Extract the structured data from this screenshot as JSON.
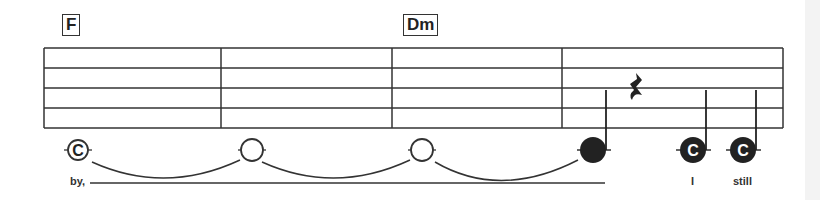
{
  "sheet": {
    "chords": [
      {
        "label": "F",
        "x": 68,
        "y": 17
      },
      {
        "label": "Dm",
        "x": 405,
        "y": 17
      }
    ],
    "staff": {
      "left": 44,
      "right": 783,
      "lines_y": [
        48,
        68,
        88,
        108,
        128
      ]
    },
    "barlines_x": [
      44,
      221,
      392,
      562,
      783
    ],
    "notes": [
      {
        "type": "whole",
        "letter": "C",
        "x": 78,
        "y": 150,
        "filled": false,
        "tied_next": true
      },
      {
        "type": "whole",
        "letter": "",
        "x": 252,
        "y": 150,
        "filled": false,
        "tied_next": true
      },
      {
        "type": "whole",
        "letter": "",
        "x": 422,
        "y": 150,
        "filled": false,
        "tied_next": true
      },
      {
        "type": "quarter",
        "letter": "",
        "x": 593,
        "y": 150,
        "filled": true,
        "tied_next": false
      },
      {
        "type": "quarter",
        "letter": "C",
        "x": 693,
        "y": 150,
        "filled": true,
        "tied_next": false
      },
      {
        "type": "quarter",
        "letter": "C",
        "x": 743,
        "y": 150,
        "filled": true,
        "tied_next": false
      }
    ],
    "rest": {
      "type": "quarter-rest",
      "x": 632,
      "y": 90
    },
    "lyrics": [
      {
        "text": "by,",
        "x": 70,
        "y": 176
      },
      {
        "text": "I",
        "x": 691,
        "y": 176
      },
      {
        "text": "still",
        "x": 735,
        "y": 176
      }
    ],
    "extender_line": {
      "x1": 90,
      "x2": 605,
      "y": 183
    }
  }
}
